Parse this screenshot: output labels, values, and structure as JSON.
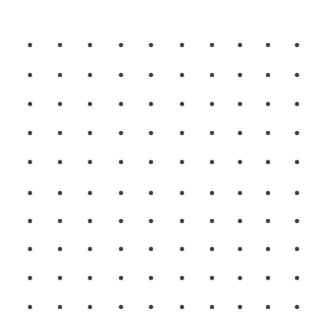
{
  "canvas": {
    "width": 326,
    "height": 333,
    "background": "#ffffff"
  },
  "grid": {
    "rows": 10,
    "cols": 10,
    "x_positions": [
      30,
      60,
      90,
      121,
      151,
      182,
      212,
      240,
      268,
      297
    ],
    "y_positions": [
      45,
      75,
      104,
      133,
      162,
      193,
      221,
      249,
      278,
      307
    ],
    "dot_color": "#3a3a3a",
    "dot_diameter": 4
  }
}
